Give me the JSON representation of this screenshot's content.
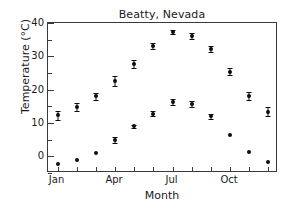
{
  "chart_data": {
    "type": "scatter",
    "title": "Beatty, Nevada",
    "xlabel": "Month",
    "ylabel": "Temperature (°C)",
    "ylim": [
      -5,
      40
    ],
    "yticks": [
      0,
      10,
      20,
      30,
      40
    ],
    "ytick_labels": [
      "0",
      "10",
      "20",
      "30",
      "40"
    ],
    "yminor_step": 5,
    "grid": false,
    "legend": "none",
    "x": [
      1,
      2,
      3,
      4,
      5,
      6,
      7,
      8,
      9,
      10,
      11,
      12
    ],
    "categories": [
      "Jan",
      "Feb",
      "Mar",
      "Apr",
      "May",
      "Jun",
      "Jul",
      "Aug",
      "Sep",
      "Oct",
      "Nov",
      "Dec"
    ],
    "xtick_labels": [
      "Jan",
      "Apr",
      "Jul",
      "Oct"
    ],
    "xtick_label_positions": [
      1,
      4,
      7,
      10
    ],
    "series": [
      {
        "name": "Mean daily maximum temperature",
        "values": [
          12.3,
          14.8,
          18.0,
          22.6,
          27.8,
          33.2,
          37.3,
          36.0,
          32.2,
          25.4,
          18.1,
          13.4
        ],
        "errors": [
          1.4,
          1.2,
          1.0,
          1.5,
          1.2,
          0.9,
          0.7,
          0.9,
          1.0,
          1.0,
          1.2,
          1.3
        ],
        "marker": "circle",
        "color": "#0d0d0d"
      },
      {
        "name": "Mean daily minimum temperature",
        "values": [
          -2.4,
          -1.0,
          1.1,
          4.9,
          9.0,
          12.8,
          16.3,
          15.6,
          12.0,
          6.5,
          1.3,
          -1.8
        ],
        "errors": [
          0.0,
          0.0,
          0.0,
          0.8,
          0.5,
          0.7,
          0.8,
          0.9,
          0.8,
          0.0,
          0.0,
          0.0
        ],
        "marker": "circle",
        "color": "#0d0d0d"
      }
    ]
  },
  "figure": {
    "title": "Beatty, Nevada",
    "axis_x_label": "Month",
    "axis_y_label": "Temperature (°C)"
  }
}
